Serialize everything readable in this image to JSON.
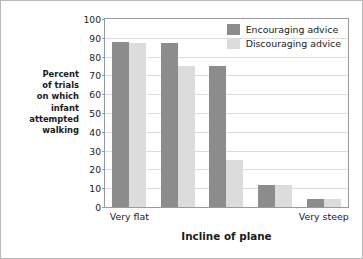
{
  "chart_data": {
    "type": "bar",
    "title": "",
    "subtitle": "",
    "xlabel": "Incline of plane",
    "ylabel": "Percent of trials on which infant attempted walking",
    "ylabel_lines": [
      "Percent",
      "of trials",
      "on which",
      "infant",
      "attempted",
      "walking"
    ],
    "categories": [
      "Very flat",
      "",
      "",
      "",
      "Very steep"
    ],
    "visible_tick_labels": [
      "Very flat",
      "Very steep"
    ],
    "series": [
      {
        "name": "Encouraging advice",
        "color": "#8c8c8c",
        "values": [
          88,
          87,
          75,
          11.5,
          4.5
        ]
      },
      {
        "name": "Discouraging advice",
        "color": "#dcdcdc",
        "values": [
          87,
          75,
          25,
          11.5,
          4.5
        ]
      }
    ],
    "ylim": [
      0,
      100
    ],
    "ytick_values": [
      0,
      10,
      20,
      30,
      40,
      50,
      60,
      70,
      80,
      90,
      100
    ],
    "ytick_labels": [
      "0",
      "10",
      "20",
      "30",
      "40",
      "50",
      "60",
      "70",
      "80",
      "90",
      "100"
    ],
    "grid": true,
    "grid_axis": "y",
    "grid_color": "#dcdcdc",
    "legend_position": "top-right-inside",
    "plot_background": "#ffffff",
    "axis_color": "#9a9a9a",
    "figure_border_color": "#b8b8b8"
  },
  "legend": {
    "entries": [
      {
        "label": "Encouraging advice",
        "color": "#8c8c8c"
      },
      {
        "label": "Discouraging advice",
        "color": "#dcdcdc"
      }
    ]
  },
  "axes": {
    "x_title": "Incline of plane",
    "x_left_label": "Very flat",
    "x_right_label": "Very steep"
  }
}
